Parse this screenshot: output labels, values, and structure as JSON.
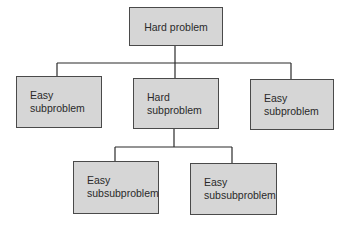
{
  "diagram": {
    "type": "tree",
    "title": "",
    "colors": {
      "node_fill": "#d6d6d6",
      "node_border": "#4a4a4a",
      "line": "#2a2a2a",
      "text": "#2a2a2a",
      "background": "#ffffff"
    },
    "nodes": [
      {
        "id": "root",
        "label": "Hard problem",
        "parent": null
      },
      {
        "id": "sub1",
        "label": "Easy\nsubproblem",
        "parent": "root"
      },
      {
        "id": "sub2",
        "label": "Hard\nsubproblem",
        "parent": "root"
      },
      {
        "id": "sub3",
        "label": "Easy\nsubproblem",
        "parent": "root"
      },
      {
        "id": "subsub1",
        "label": "Easy\nsubsubproblem",
        "parent": "sub2"
      },
      {
        "id": "subsub2",
        "label": "Easy\nsubsubproblem",
        "parent": "sub2"
      }
    ],
    "edges": [
      {
        "from": "root",
        "to": "sub1"
      },
      {
        "from": "root",
        "to": "sub2"
      },
      {
        "from": "root",
        "to": "sub3"
      },
      {
        "from": "sub2",
        "to": "subsub1"
      },
      {
        "from": "sub2",
        "to": "subsub2"
      }
    ]
  }
}
